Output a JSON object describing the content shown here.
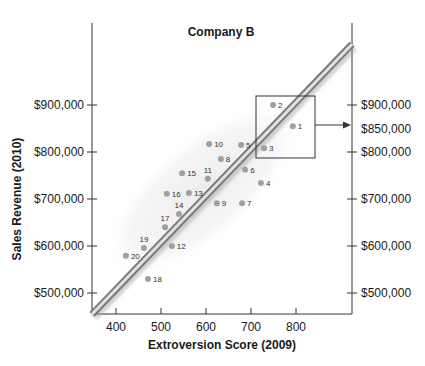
{
  "chart_data": {
    "type": "scatter",
    "title": "Company B",
    "xlabel": "Extroversion Score (2009)",
    "ylabel": "Sales Revenue (2010)",
    "xlim": [
      347,
      920
    ],
    "ylim": [
      450000,
      1070000
    ],
    "x_ticks": [
      400,
      500,
      600,
      700,
      800
    ],
    "x_tick_labels": [
      "400",
      "500",
      "600",
      "700",
      "800"
    ],
    "y_ticks": [
      500000,
      600000,
      700000,
      800000,
      900000
    ],
    "y_tick_labels": [
      "$500,000",
      "$600,000",
      "$700,000",
      "$800,000",
      "$900,000"
    ],
    "right_axis": {
      "ticks": [
        500000,
        600000,
        700000,
        800000,
        900000
      ],
      "tick_labels": [
        "$500,000",
        "$600,000",
        "$700,000",
        "$800,000",
        "$900,000"
      ],
      "highlight_value": 850000,
      "highlight_label": "$850,000"
    },
    "grid": false,
    "legend": null,
    "points": [
      {
        "id": "1",
        "x": 793,
        "y": 855000
      },
      {
        "id": "2",
        "x": 749,
        "y": 900000
      },
      {
        "id": "3",
        "x": 729,
        "y": 808000
      },
      {
        "id": "4",
        "x": 722,
        "y": 734000
      },
      {
        "id": "5",
        "x": 678,
        "y": 815000
      },
      {
        "id": "6",
        "x": 687,
        "y": 762000
      },
      {
        "id": "7",
        "x": 680,
        "y": 691000
      },
      {
        "id": "8",
        "x": 633,
        "y": 785000
      },
      {
        "id": "9",
        "x": 624,
        "y": 691000
      },
      {
        "id": "10",
        "x": 607,
        "y": 817000
      },
      {
        "id": "11",
        "x": 604,
        "y": 743000
      },
      {
        "id": "12",
        "x": 524,
        "y": 600000
      },
      {
        "id": "13",
        "x": 562,
        "y": 713000
      },
      {
        "id": "14",
        "x": 540,
        "y": 668000
      },
      {
        "id": "15",
        "x": 547,
        "y": 755000
      },
      {
        "id": "16",
        "x": 513,
        "y": 711000
      },
      {
        "id": "17",
        "x": 509,
        "y": 640000
      },
      {
        "id": "18",
        "x": 471,
        "y": 530000
      },
      {
        "id": "19",
        "x": 462,
        "y": 596000
      },
      {
        "id": "20",
        "x": 422,
        "y": 579000
      }
    ],
    "regression_line": {
      "x0": 347,
      "y0": 455000,
      "x1": 920,
      "y1": 1025000
    },
    "annotations": [
      {
        "type": "highlight-box",
        "around_points": [
          "1",
          "2",
          "3"
        ],
        "arrow_to": "$850,000"
      },
      {
        "type": "shaded-ellipse",
        "note": "data cloud"
      }
    ],
    "colors": {
      "point": "#a0a0a0",
      "line_edge": "#7a7a7a",
      "line_core": "#e2e2e2",
      "ellipse": "#f2f2f2",
      "axis": "#333333"
    }
  }
}
